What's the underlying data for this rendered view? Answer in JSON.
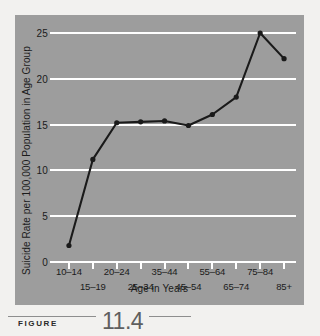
{
  "figure": {
    "caption_word": "FIGURE",
    "caption_number": "11.4"
  },
  "colors": {
    "page_background": "#f2f1ef",
    "panel_background": "#9d9d9d",
    "gridline": "#ffffff",
    "series_line": "#1a1a1a",
    "marker": "#1a1a1a",
    "text": "#1b1b1b",
    "caption_number": "#5f5f5f",
    "caption_rule": "#8e8e8e"
  },
  "chart_data": {
    "type": "line",
    "title": "",
    "xlabel": "Age in Years",
    "ylabel": "Suicide Rate per 100,000 Population in Age Group",
    "categories": [
      "10–14",
      "15–19",
      "20–24",
      "25–34",
      "35–44",
      "45–54",
      "55–64",
      "65–74",
      "75–84",
      "85+"
    ],
    "values": [
      1.8,
      11.2,
      15.2,
      15.3,
      15.4,
      14.9,
      16.1,
      18.0,
      25.0,
      22.2
    ],
    "series": [
      {
        "name": "Suicide rate",
        "values": [
          1.8,
          11.2,
          15.2,
          15.3,
          15.4,
          14.9,
          16.1,
          18.0,
          25.0,
          22.2
        ]
      }
    ],
    "ylim": [
      0,
      25
    ],
    "yticks": [
      0,
      5,
      10,
      15,
      20,
      25
    ],
    "ytick_labels": [
      "0",
      "5",
      "10",
      "15",
      "20",
      "25"
    ],
    "grid": true,
    "grid_axis": "y",
    "legend": false,
    "legend_position": "none",
    "markers": true,
    "xtick_label_rows": [
      {
        "row": "top",
        "labels": [
          "10–14",
          "20–24",
          "35–44",
          "55–64",
          "75–84"
        ]
      },
      {
        "row": "bottom",
        "labels": [
          "15–19",
          "25–34",
          "45–54",
          "65–74",
          "85+"
        ]
      }
    ]
  }
}
